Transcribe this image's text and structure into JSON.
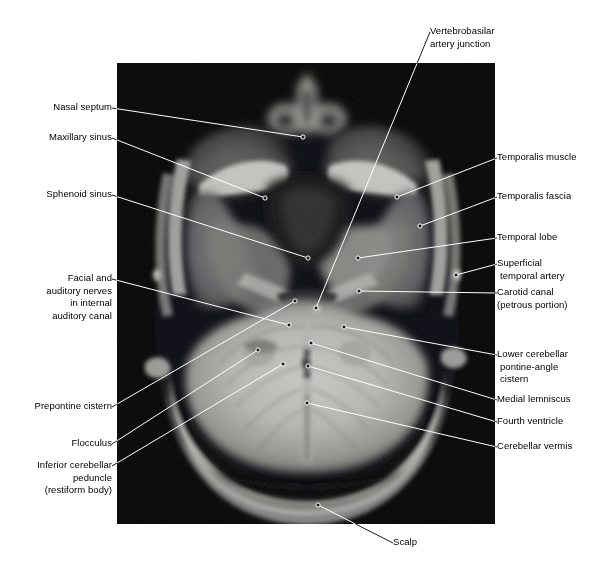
{
  "figure": {
    "kind": "axial-mri-brain-scan",
    "modality": "MRI",
    "plane": "axial",
    "region": "posterior fossa / skull base",
    "image_frame": {
      "x": 117,
      "y": 63,
      "width": 378,
      "height": 461
    },
    "canvas": {
      "width": 611,
      "height": 576
    },
    "colors": {
      "background": "#ffffff",
      "scan_background": "#050505",
      "leader_line_on_white": "#000000",
      "leader_line_on_scan": "#ffffff",
      "text": "#000000"
    }
  },
  "labels": [
    {
      "id": "nasal-septum",
      "name": "nasal-septum",
      "side": "left",
      "lines": [
        "Nasal septum"
      ],
      "text_anchor": {
        "x": 112,
        "y": 108
      },
      "target": {
        "x": 303,
        "y": 137
      }
    },
    {
      "id": "maxillary-sinus",
      "name": "maxillary-sinus",
      "side": "left",
      "lines": [
        "Maxillary sinus"
      ],
      "text_anchor": {
        "x": 112,
        "y": 138
      },
      "target": {
        "x": 265,
        "y": 198
      }
    },
    {
      "id": "sphenoid-sinus",
      "name": "sphenoid-sinus",
      "side": "left",
      "lines": [
        "Sphenoid sinus"
      ],
      "text_anchor": {
        "x": 112,
        "y": 195
      },
      "target": {
        "x": 308,
        "y": 258
      }
    },
    {
      "id": "facial-auditory-nerves",
      "name": "facial-and-auditory-nerves-internal-auditory-canal",
      "side": "left",
      "lines": [
        "Facial and",
        "auditory  nerves",
        "in internal",
        "auditory canal"
      ],
      "text_anchor": {
        "x": 112,
        "y": 279
      },
      "target": {
        "x": 289,
        "y": 325
      }
    },
    {
      "id": "prepontine-cistern",
      "name": "prepontine-cistern",
      "side": "left",
      "lines": [
        "Prepontine cistern"
      ],
      "text_anchor": {
        "x": 112,
        "y": 407
      },
      "target": {
        "x": 295,
        "y": 301
      }
    },
    {
      "id": "flocculus",
      "name": "flocculus",
      "side": "left",
      "lines": [
        "Flocculus"
      ],
      "text_anchor": {
        "x": 112,
        "y": 444
      },
      "target": {
        "x": 258,
        "y": 350
      }
    },
    {
      "id": "inferior-cerebellar-peduncle",
      "name": "inferior-cerebellar-peduncle-restiform-body",
      "side": "left",
      "lines": [
        "Inferior cerebellar",
        "peduncle",
        "(restiform body)"
      ],
      "text_anchor": {
        "x": 112,
        "y": 466
      },
      "target": {
        "x": 283,
        "y": 364
      }
    },
    {
      "id": "vertebrobasilar-artery-junction",
      "name": "vertebrobasilar-artery-junction",
      "side": "center",
      "lines": [
        "Vertebrobasilar",
        "artery junction"
      ],
      "text_anchor": {
        "x": 430,
        "y": 32
      },
      "target": {
        "x": 316,
        "y": 308
      }
    },
    {
      "id": "temporalis-muscle",
      "name": "temporalis-muscle",
      "side": "right",
      "lines": [
        "Temporalis muscle"
      ],
      "text_anchor": {
        "x": 497,
        "y": 158
      },
      "target": {
        "x": 397,
        "y": 197
      }
    },
    {
      "id": "temporalis-fascia",
      "name": "temporalis-fascia",
      "side": "right",
      "lines": [
        "Temporalis fascia"
      ],
      "text_anchor": {
        "x": 497,
        "y": 197
      },
      "target": {
        "x": 420,
        "y": 226
      }
    },
    {
      "id": "temporal-lobe",
      "name": "temporal-lobe",
      "side": "right",
      "lines": [
        "Temporal lobe"
      ],
      "text_anchor": {
        "x": 497,
        "y": 238
      },
      "target": {
        "x": 358,
        "y": 258
      }
    },
    {
      "id": "superficial-temporal-artery",
      "name": "superficial-temporal-artery",
      "side": "right",
      "lines": [
        "Superficial",
        "temporal  artery"
      ],
      "text_anchor": {
        "x": 497,
        "y": 264
      },
      "target": {
        "x": 456,
        "y": 275
      }
    },
    {
      "id": "carotid-canal",
      "name": "carotid-canal-petrous-portion",
      "side": "right",
      "lines": [
        "Carotid canal",
        "(petrous portion)"
      ],
      "text_anchor": {
        "x": 497,
        "y": 293
      },
      "target": {
        "x": 359,
        "y": 291
      }
    },
    {
      "id": "lower-cerebellar-pontine-angle-cistern",
      "name": "lower-cerebellar-pontine-angle-cistern",
      "side": "right",
      "lines": [
        "Lower cerebellar",
        "pontine-angle",
        "cistern"
      ],
      "text_anchor": {
        "x": 497,
        "y": 355
      },
      "target": {
        "x": 344,
        "y": 327
      }
    },
    {
      "id": "medial-lemniscus",
      "name": "medial-lemniscus",
      "side": "right",
      "lines": [
        "Medial lemniscus"
      ],
      "text_anchor": {
        "x": 497,
        "y": 400
      },
      "target": {
        "x": 311,
        "y": 343
      }
    },
    {
      "id": "fourth-ventricle",
      "name": "fourth-ventricle",
      "side": "right",
      "lines": [
        "Fourth ventricle"
      ],
      "text_anchor": {
        "x": 497,
        "y": 422
      },
      "target": {
        "x": 308,
        "y": 366
      }
    },
    {
      "id": "cerebellar-vermis",
      "name": "cerebellar-vermis",
      "side": "right",
      "lines": [
        "Cerebellar vermis"
      ],
      "text_anchor": {
        "x": 497,
        "y": 447
      },
      "target": {
        "x": 307,
        "y": 403
      }
    },
    {
      "id": "scalp",
      "name": "scalp",
      "side": "right",
      "lines": [
        "Scalp"
      ],
      "text_anchor": {
        "x": 393,
        "y": 543
      },
      "target": {
        "x": 318,
        "y": 505
      }
    }
  ]
}
